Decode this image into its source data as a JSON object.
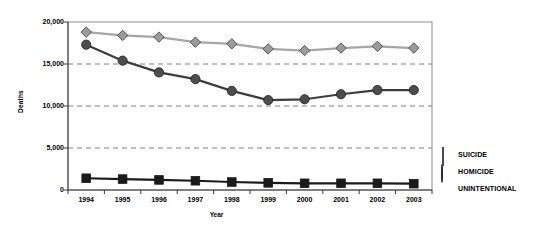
{
  "chart_data": {
    "type": "line",
    "title": "",
    "xlabel": "Year",
    "ylabel": "Deaths",
    "categories": [
      "1994",
      "1995",
      "1996",
      "1997",
      "1998",
      "1999",
      "2000",
      "2001",
      "2002",
      "2003"
    ],
    "ylim": [
      0,
      20000
    ],
    "yticks": [
      0,
      5000,
      10000,
      15000,
      20000
    ],
    "ytick_labels": [
      "0",
      "5,000",
      "10,000",
      "15,000",
      "20,000"
    ],
    "grid": "horizontal-dashed",
    "legend_position": "right",
    "series": [
      {
        "name": "SUICIDE",
        "marker": "diamond",
        "color": "#9b9b9b",
        "line_color": "#a6a6a6",
        "values": [
          18800,
          18400,
          18200,
          17600,
          17400,
          16800,
          16600,
          16900,
          17100,
          16900
        ]
      },
      {
        "name": "HOMICIDE",
        "marker": "circle",
        "color": "#4d4d4d",
        "line_color": "#3d3d3d",
        "values": [
          17300,
          15400,
          14000,
          13200,
          11800,
          10700,
          10800,
          11400,
          11900,
          11900
        ]
      },
      {
        "name": "UNINTENTIONAL",
        "marker": "square",
        "color": "#1a1a1a",
        "line_color": "#1a1a1a",
        "values": [
          1400,
          1300,
          1200,
          1100,
          950,
          850,
          800,
          800,
          800,
          750
        ]
      }
    ]
  },
  "axis": {
    "y_title": "Deaths",
    "x_title": "Year"
  },
  "legend": {
    "items": [
      {
        "label": "SUICIDE",
        "swatch": "diamond-icon"
      },
      {
        "label": "HOMICIDE",
        "swatch": "circle-icon"
      },
      {
        "label": "UNINTENTIONAL",
        "swatch": "square-icon"
      }
    ]
  },
  "colors": {
    "suicide": "#9b9b9b",
    "homicide": "#4d4d4d",
    "unintentional": "#1a1a1a",
    "grid": "#808080",
    "frame": "#8c8c8c"
  }
}
